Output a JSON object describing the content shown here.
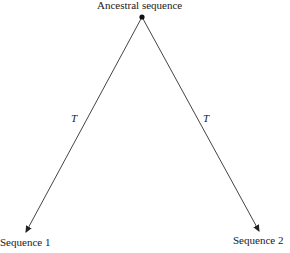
{
  "diagram": {
    "root": {
      "label": "Ancestral sequence"
    },
    "leaves": [
      {
        "label": "Sequence 1"
      },
      {
        "label": "Sequence 2"
      }
    ],
    "branches": [
      {
        "label": "T",
        "from": "Ancestral sequence",
        "to": "Sequence 1"
      },
      {
        "label": "T",
        "from": "Ancestral sequence",
        "to": "Sequence 2"
      }
    ],
    "colors": {
      "line": "#333333",
      "text": "#1a1a1a",
      "background": "#ffffff"
    }
  }
}
